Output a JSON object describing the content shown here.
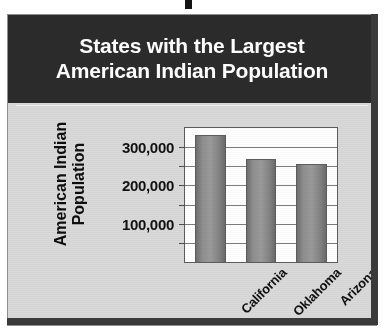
{
  "figure": {
    "title_line_1": "States with the Largest",
    "title_line_2": "American Indian Population",
    "title_band_color": "#2c2c2c",
    "title_text_color": "#ffffff",
    "body_background_color": "#d9d9d9",
    "plot_background_color": "#ffffff",
    "bar_color": "#8f8f8f",
    "axis_color": "#5c5c5c"
  },
  "y_axis": {
    "title_line_1": "American Indian",
    "title_line_2": "Population",
    "ticks": [
      {
        "label": "300,000",
        "value": 300000
      },
      {
        "label": "200,000",
        "value": 200000
      },
      {
        "label": "100,000",
        "value": 100000
      }
    ]
  },
  "chart_data": {
    "type": "bar",
    "title": "States with the Largest American Indian Population",
    "xlabel": "",
    "ylabel": "American Indian Population",
    "categories": [
      "California",
      "Oklahoma",
      "Arizona"
    ],
    "values": [
      333000,
      270000,
      256000
    ],
    "series": [
      {
        "name": "American Indian Population",
        "values": [
          333000,
          270000,
          256000
        ]
      }
    ],
    "ylim": [
      0,
      350000
    ],
    "ytick_values": [
      50000,
      100000,
      150000,
      200000,
      250000,
      300000,
      350000
    ],
    "ytick_labels_shown": [
      "100,000",
      "200,000",
      "300,000"
    ],
    "grid": true,
    "grid_axis": "y",
    "legend": false,
    "legend_position": "none",
    "orientation": "vertical",
    "xtick_rotation_deg": -45
  }
}
